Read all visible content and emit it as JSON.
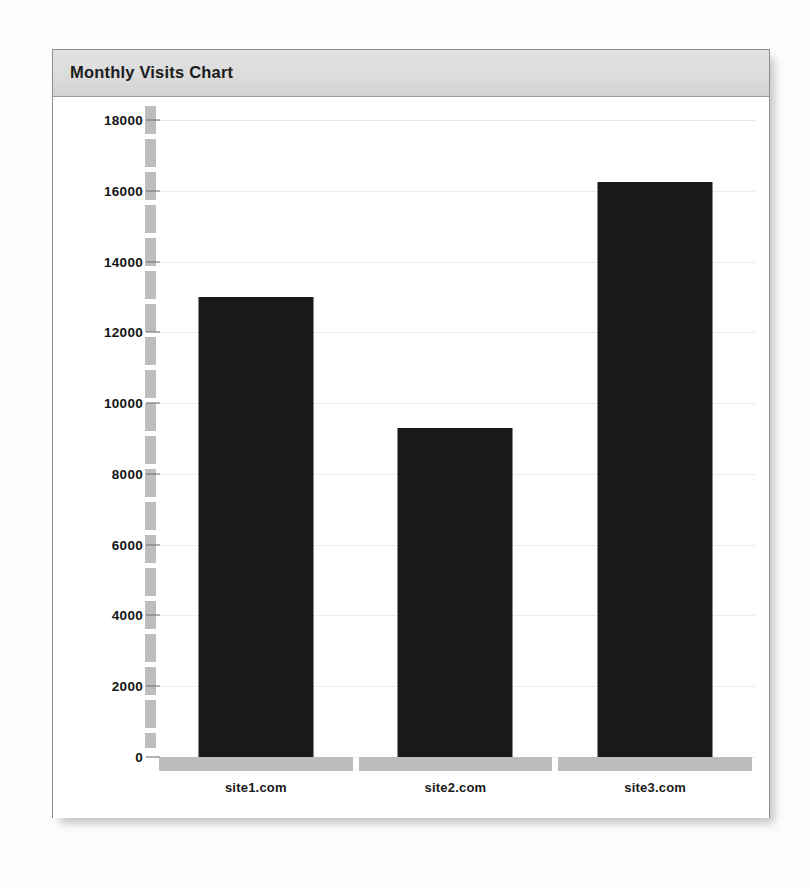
{
  "panel": {
    "title": "Monthly Visits Chart"
  },
  "chart_data": {
    "type": "bar",
    "title": "Monthly Visits Chart",
    "categories": [
      "site1.com",
      "site2.com",
      "site3.com"
    ],
    "values": [
      13000,
      9300,
      16250
    ],
    "series": [
      {
        "name": "Monthly Visits",
        "values": [
          13000,
          9300,
          16250
        ]
      }
    ],
    "xlabel": "",
    "ylabel": "",
    "ylim": [
      0,
      18000
    ],
    "ytick_step": 2000,
    "yticks": [
      0,
      2000,
      4000,
      6000,
      8000,
      10000,
      12000,
      14000,
      16000,
      18000
    ],
    "ytick_labels": [
      "0",
      "2000",
      "4000",
      "6000",
      "8000",
      "10000",
      "12000",
      "14000",
      "16000",
      "18000"
    ],
    "grid": true,
    "grid_axis": "y",
    "legend": false,
    "legend_position": "none",
    "bar_color": "#191919",
    "axis_color": "#bdbdbd",
    "gridline_color": "#ececec",
    "orientation": "vertical"
  },
  "colors": {
    "page_background": "#fdfdfd",
    "panel_background": "#ffffff",
    "panel_border": "#8e8e8e",
    "header_background": "#dcdcdc",
    "title_text": "#1b1b1b",
    "tick_text": "#141414",
    "bar_fill": "#191919",
    "axis_band": "#bdbdbd",
    "gridline": "#ececec"
  }
}
